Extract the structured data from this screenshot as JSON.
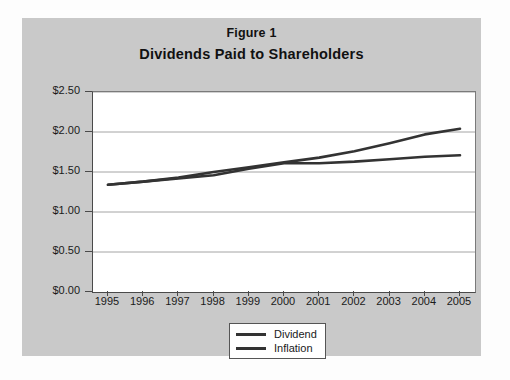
{
  "figure": {
    "label": "Figure 1",
    "subtitle": "Dividends Paid to Shareholders"
  },
  "legend": {
    "items": [
      {
        "label": "Dividend",
        "color": "#333333"
      },
      {
        "label": "Inflation",
        "color": "#333333"
      }
    ]
  },
  "colors": {
    "panel_background": "#c9c9c9",
    "plot_background": "#ffffff",
    "axis": "#4a4a4a",
    "gridline": "#9a9a9a",
    "series_line": "#333333",
    "text": "#1a1a1a"
  },
  "chart_data": {
    "type": "line",
    "title": "Dividends Paid to Shareholders",
    "subtitle": "Figure 1",
    "xlabel": "",
    "ylabel": "",
    "categories": [
      "1995",
      "1996",
      "1997",
      "1998",
      "1999",
      "2000",
      "2001",
      "2002",
      "2003",
      "2004",
      "2005"
    ],
    "x": [
      1995,
      1996,
      1997,
      1998,
      1999,
      2000,
      2001,
      2002,
      2003,
      2004,
      2005
    ],
    "ylim": [
      0.0,
      2.5
    ],
    "yticks": [
      0.0,
      0.5,
      1.0,
      1.5,
      2.0,
      2.5
    ],
    "ytick_labels": [
      "$0.00",
      "$0.50",
      "$1.00",
      "$1.50",
      "$2.00",
      "$2.50"
    ],
    "grid": true,
    "legend_position": "bottom-center",
    "series": [
      {
        "name": "Dividend",
        "color": "#333333",
        "values": [
          1.34,
          1.38,
          1.43,
          1.5,
          1.56,
          1.62,
          1.68,
          1.76,
          1.86,
          1.97,
          2.04
        ]
      },
      {
        "name": "Inflation",
        "color": "#333333",
        "values": [
          1.34,
          1.38,
          1.42,
          1.46,
          1.54,
          1.61,
          1.61,
          1.63,
          1.66,
          1.69,
          1.71
        ]
      }
    ]
  }
}
